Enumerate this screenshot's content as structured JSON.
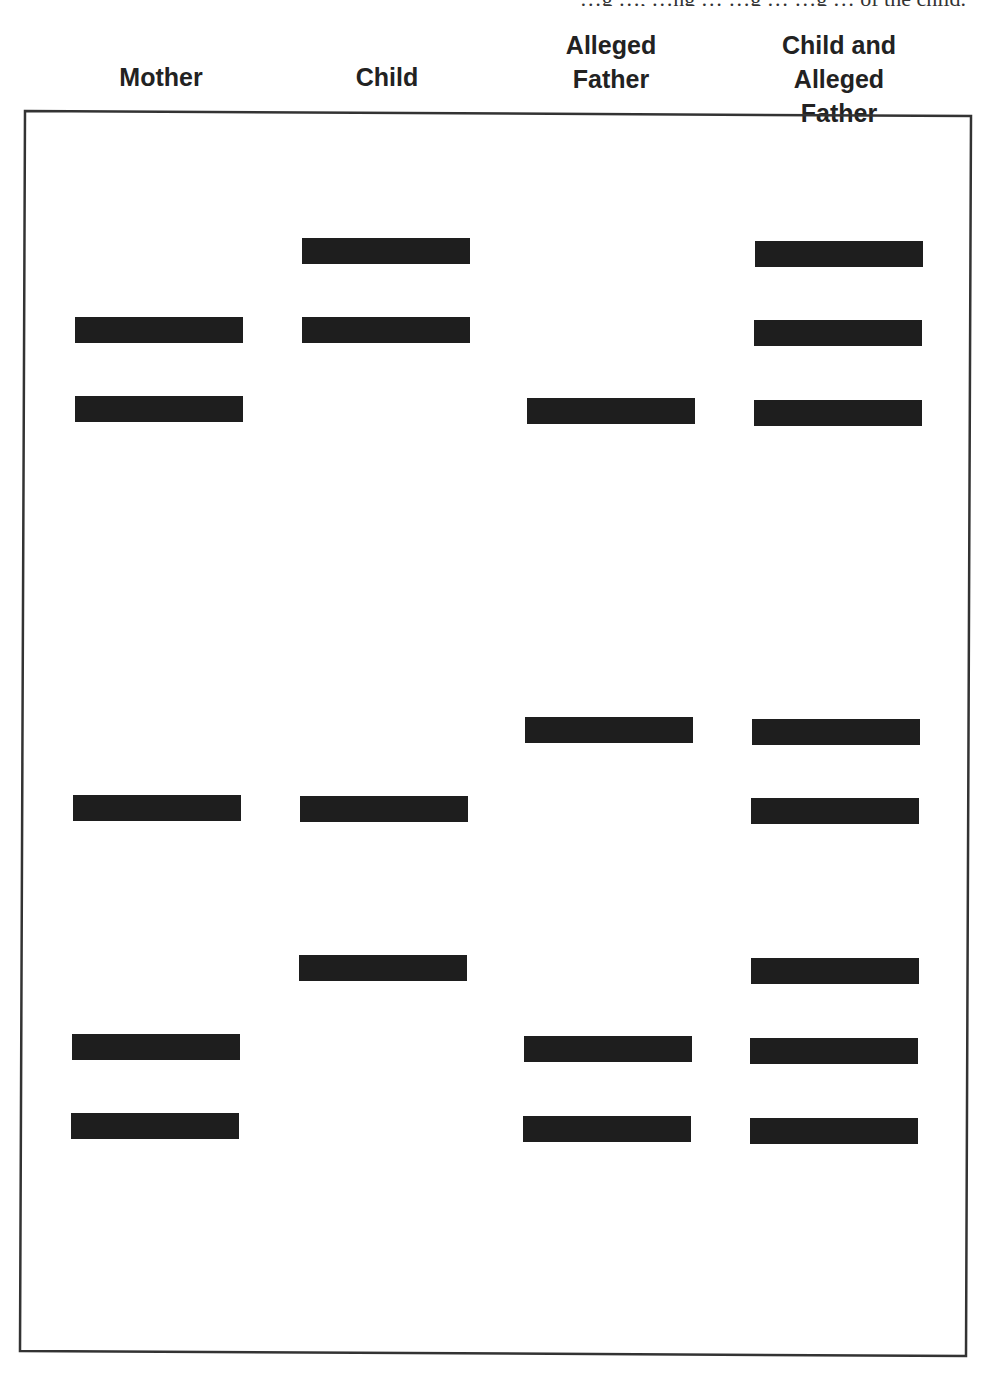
{
  "caption_fragment": "…g …, …ng … …g … …g … of the child.",
  "columns": [
    {
      "id": "mother",
      "label_lines": [
        "Mother"
      ],
      "center_x": 161,
      "header_y": 60
    },
    {
      "id": "child",
      "label_lines": [
        "Child"
      ],
      "center_x": 387,
      "header_y": 60
    },
    {
      "id": "alleged-father",
      "label_lines": [
        "Alleged",
        "Father"
      ],
      "center_x": 611,
      "header_y": 28
    },
    {
      "id": "child-and-alleged-father",
      "label_lines": [
        "Child and",
        "Alleged Father"
      ],
      "center_x": 839,
      "header_y": 28
    }
  ],
  "gel": {
    "border_color": "#333333",
    "corners": {
      "tl": [
        25,
        111
      ],
      "tr": [
        971,
        116
      ],
      "br": [
        966,
        1356
      ],
      "bl": [
        20,
        1351
      ]
    }
  },
  "bands": {
    "mother": [
      {
        "x": 75,
        "y": 317
      },
      {
        "x": 75,
        "y": 396
      },
      {
        "x": 73,
        "y": 795
      },
      {
        "x": 72,
        "y": 1034
      },
      {
        "x": 71,
        "y": 1113
      }
    ],
    "child": [
      {
        "x": 302,
        "y": 238
      },
      {
        "x": 302,
        "y": 317
      },
      {
        "x": 300,
        "y": 796
      },
      {
        "x": 299,
        "y": 955
      }
    ],
    "alleged-father": [
      {
        "x": 527,
        "y": 398
      },
      {
        "x": 525,
        "y": 717
      },
      {
        "x": 524,
        "y": 1036
      },
      {
        "x": 523,
        "y": 1116
      }
    ],
    "child-and-alleged-father": [
      {
        "x": 755,
        "y": 241
      },
      {
        "x": 754,
        "y": 320
      },
      {
        "x": 754,
        "y": 400
      },
      {
        "x": 752,
        "y": 719
      },
      {
        "x": 751,
        "y": 798
      },
      {
        "x": 751,
        "y": 958
      },
      {
        "x": 750,
        "y": 1038
      },
      {
        "x": 750,
        "y": 1118
      }
    ]
  },
  "band_style": {
    "width": 168,
    "height": 26,
    "color": "#1e1e1e"
  }
}
